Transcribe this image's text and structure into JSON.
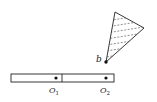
{
  "diagram": {
    "labels": {
      "b": "b",
      "o1_main": "O",
      "o1_sub": "1",
      "o2_main": "O",
      "o2_sub": "2"
    },
    "colors": {
      "stroke": "#222222",
      "background": "#ffffff"
    },
    "elements": [
      "triangular plate with dashed hatching, pivoted at point b",
      "horizontal rod composed of two segments joined at a divider",
      "point O1 on left segment",
      "point O2 on right segment"
    ]
  }
}
